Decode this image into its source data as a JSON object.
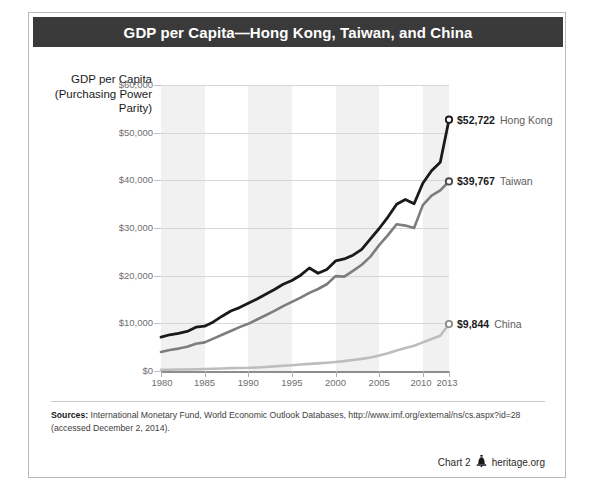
{
  "title": "GDP per Capita—Hong Kong, Taiwan, and China",
  "axis_title": "GDP per Capita (Purchasing Power Parity)",
  "footer": {
    "chart_number": "Chart 2",
    "site": "heritage.org",
    "logo_icon": "liberty-bell-icon"
  },
  "sources": {
    "label": "Sources:",
    "text": "International Monetary Fund, World Economic Outlook Databases, http://www.imf.org/external/ns/cs.aspx?id=28 (accessed December 2, 2014)."
  },
  "colors": {
    "hong_kong": "#1a1a1a",
    "taiwan": "#7d7d7d",
    "china": "#bdbdbd",
    "title_bar": "#3a3a3a",
    "band": "#f1f1f1",
    "gridline": "#d6d6d6"
  },
  "chart_data": {
    "type": "line",
    "title": "GDP per Capita—Hong Kong, Taiwan, and China",
    "xlabel": "",
    "ylabel": "GDP per Capita (Purchasing Power Parity)",
    "xlim": [
      1980,
      2013
    ],
    "ylim": [
      0,
      60000
    ],
    "ytick_labels": [
      "$0",
      "$10,000",
      "$20,000",
      "$30,000",
      "$40,000",
      "$50,000",
      "$60,000"
    ],
    "yticks": [
      0,
      10000,
      20000,
      30000,
      40000,
      50000,
      60000
    ],
    "xtick_labels": [
      "1980",
      "1985",
      "1990",
      "1995",
      "2000",
      "2005",
      "2010",
      "2013"
    ],
    "xticks": [
      1980,
      1985,
      1990,
      1995,
      2000,
      2005,
      2010,
      2013
    ],
    "grid": "horizontal",
    "legend": "end-of-line labels",
    "x": [
      1980,
      1981,
      1982,
      1983,
      1984,
      1985,
      1986,
      1987,
      1988,
      1989,
      1990,
      1991,
      1992,
      1993,
      1994,
      1995,
      1996,
      1997,
      1998,
      1999,
      2000,
      2001,
      2002,
      2003,
      2004,
      2005,
      2006,
      2007,
      2008,
      2009,
      2010,
      2011,
      2012,
      2013
    ],
    "series": [
      {
        "name": "Hong Kong",
        "color": "#1a1a1a",
        "end_label": "$52,722",
        "end_value": 52722,
        "values": [
          7100,
          7600,
          7900,
          8300,
          9200,
          9400,
          10300,
          11500,
          12600,
          13300,
          14200,
          15100,
          16100,
          17100,
          18200,
          19000,
          20100,
          21600,
          20500,
          21300,
          23100,
          23500,
          24300,
          25500,
          27700,
          29900,
          32300,
          35000,
          36000,
          35100,
          39400,
          42000,
          43800,
          52722
        ]
      },
      {
        "name": "Taiwan",
        "color": "#7d7d7d",
        "end_label": "$39,767",
        "end_value": 39767,
        "values": [
          4000,
          4400,
          4700,
          5100,
          5700,
          6000,
          6800,
          7600,
          8400,
          9200,
          9900,
          10800,
          11700,
          12600,
          13600,
          14500,
          15400,
          16400,
          17200,
          18200,
          19900,
          19800,
          21000,
          22300,
          24000,
          26400,
          28500,
          30800,
          30500,
          30000,
          34800,
          36800,
          37900,
          39767
        ]
      },
      {
        "name": "China",
        "color": "#bdbdbd",
        "end_label": "$9,844",
        "end_value": 9844,
        "values": [
          250,
          270,
          300,
          330,
          380,
          430,
          470,
          530,
          600,
          640,
          670,
          740,
          840,
          960,
          1090,
          1220,
          1350,
          1490,
          1610,
          1740,
          1900,
          2080,
          2290,
          2540,
          2850,
          3230,
          3700,
          4300,
          4800,
          5300,
          6000,
          6700,
          7400,
          9844
        ]
      }
    ]
  }
}
